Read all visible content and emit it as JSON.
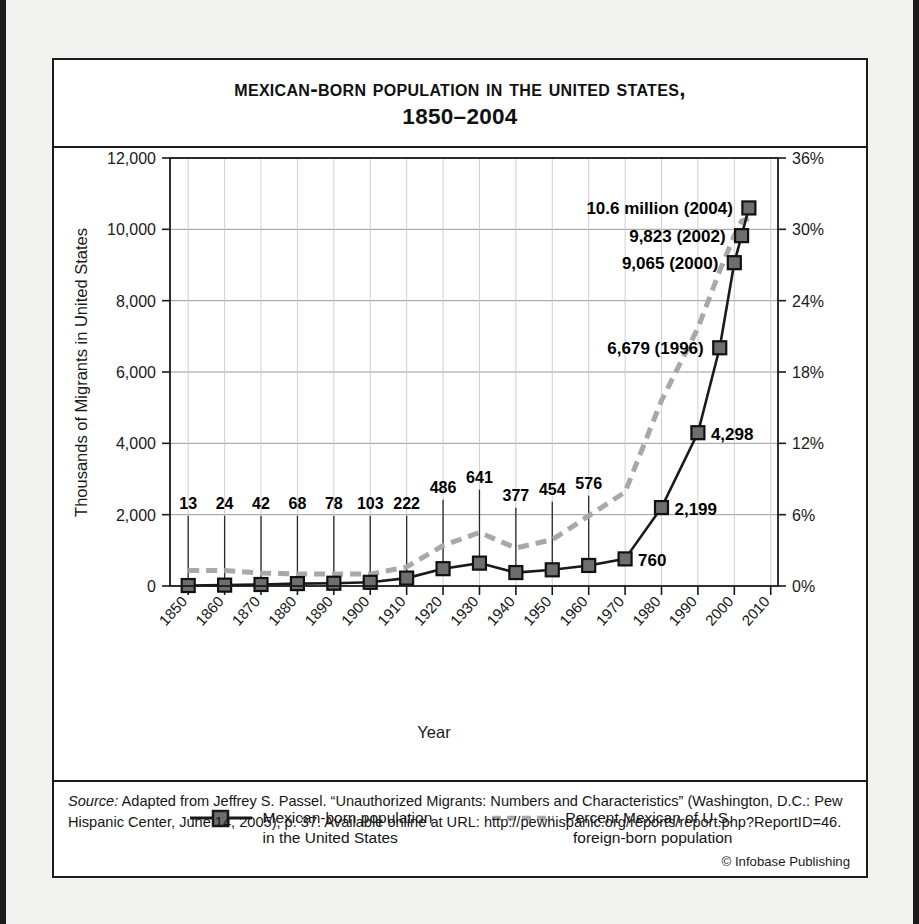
{
  "figure": {
    "title_line1": "Mexican-Born Population  in the United States,",
    "title_line2": "1850–2004"
  },
  "source": {
    "label": "Source:",
    "text": " Adapted from Jeffrey S. Passel. “Unauthorized Migrants: Numbers and Characteristics” (Washington, D.C.: Pew Hispanic Center, June 14, 2005), p. 37. Available online at URL: http://pewhispanic.org/reports/report.php?ReportID=46.",
    "copyright": "© Infobase Publishing"
  },
  "legend": {
    "items": [
      {
        "label": "Mexican-born population\nin the United States",
        "style": "solid-square-marker",
        "color": "#1a1a1a",
        "marker_color": "#6e6e6e"
      },
      {
        "label": "Percent Mexican of U.S.\nforeign-born population",
        "style": "dashed",
        "color": "#a8a8a8"
      }
    ]
  },
  "chart_data": {
    "type": "line",
    "title": "Mexican-Born Population in the United States, 1850–2004",
    "xlabel": "Year",
    "ylabel": "Thousands of Migrants in United States",
    "y2label": "",
    "xlim": [
      1845,
      2012
    ],
    "ylim": [
      0,
      12000
    ],
    "y2lim": [
      0,
      36
    ],
    "grid": true,
    "legend_position": "bottom",
    "yticks": [
      "0",
      "2,000",
      "4,000",
      "6,000",
      "8,000",
      "10,000",
      "12,000"
    ],
    "ytick_values": [
      0,
      2000,
      4000,
      6000,
      8000,
      10000,
      12000
    ],
    "y2ticks": [
      "0%",
      "6%",
      "12%",
      "18%",
      "24%",
      "30%",
      "36%"
    ],
    "y2tick_values": [
      0,
      6,
      12,
      18,
      24,
      30,
      36
    ],
    "xticks": [
      "1850",
      "1860",
      "1870",
      "1880",
      "1890",
      "1900",
      "1910",
      "1920",
      "1930",
      "1940",
      "1950",
      "1960",
      "1970",
      "1980",
      "1990",
      "2000",
      "2010"
    ],
    "xtick_values": [
      1850,
      1860,
      1870,
      1880,
      1890,
      1900,
      1910,
      1920,
      1930,
      1940,
      1950,
      1960,
      1970,
      1980,
      1990,
      2000,
      2010
    ],
    "series": [
      {
        "name": "Mexican-born population in the United States",
        "axis": "left",
        "style": "solid",
        "marker": "square",
        "color": "#1a1a1a",
        "marker_color": "#6e6e6e",
        "x": [
          1850,
          1860,
          1870,
          1880,
          1890,
          1900,
          1910,
          1920,
          1930,
          1940,
          1950,
          1960,
          1970,
          1980,
          1990,
          1996,
          2000,
          2002,
          2004
        ],
        "values": [
          13,
          24,
          42,
          68,
          78,
          103,
          222,
          486,
          641,
          377,
          454,
          576,
          760,
          2199,
          4298,
          6679,
          9065,
          9823,
          10600
        ]
      },
      {
        "name": "Percent Mexican of U.S. foreign-born population",
        "axis": "right",
        "style": "dashed",
        "color": "#a8a8a8",
        "x": [
          1850,
          1860,
          1870,
          1880,
          1890,
          1900,
          1910,
          1920,
          1930,
          1940,
          1950,
          1960,
          1970,
          1980,
          1990,
          1996,
          2000,
          2002,
          2004
        ],
        "values": [
          1.3,
          1.3,
          1.1,
          1.0,
          1.0,
          1.0,
          1.6,
          3.4,
          4.5,
          3.2,
          3.9,
          5.9,
          7.9,
          15.6,
          21.7,
          26.5,
          29.5,
          30.7,
          30.9
        ]
      }
    ],
    "point_labels": [
      {
        "year": 1850,
        "text": "13",
        "kind": "leader"
      },
      {
        "year": 1860,
        "text": "24",
        "kind": "leader"
      },
      {
        "year": 1870,
        "text": "42",
        "kind": "leader"
      },
      {
        "year": 1880,
        "text": "68",
        "kind": "leader"
      },
      {
        "year": 1890,
        "text": "78",
        "kind": "leader"
      },
      {
        "year": 1900,
        "text": "103",
        "kind": "leader"
      },
      {
        "year": 1910,
        "text": "222",
        "kind": "leader"
      },
      {
        "year": 1920,
        "text": "486",
        "kind": "leader"
      },
      {
        "year": 1930,
        "text": "641",
        "kind": "leader"
      },
      {
        "year": 1940,
        "text": "377",
        "kind": "leader"
      },
      {
        "year": 1950,
        "text": "454",
        "kind": "leader"
      },
      {
        "year": 1960,
        "text": "576",
        "kind": "leader"
      },
      {
        "year": 1970,
        "text": "760",
        "kind": "inline"
      },
      {
        "year": 1980,
        "text": "2,199",
        "kind": "inline"
      },
      {
        "year": 1990,
        "text": "4,298",
        "kind": "inline"
      },
      {
        "year": 1996,
        "text": "6,679 (1996)",
        "kind": "annotation"
      },
      {
        "year": 2000,
        "text": "9,065 (2000)",
        "kind": "annotation"
      },
      {
        "year": 2002,
        "text": "9,823 (2002)",
        "kind": "annotation"
      },
      {
        "year": 2004,
        "text": "10.6 million (2004)",
        "kind": "annotation"
      }
    ]
  }
}
